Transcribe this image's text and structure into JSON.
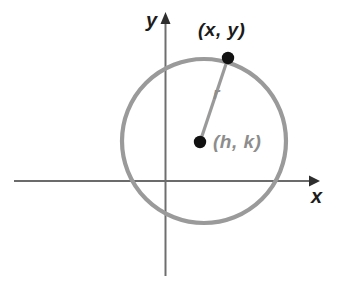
{
  "figure": {
    "kind": "circle-diagram",
    "background_color": "#ffffff"
  },
  "axes": {
    "x_label": "x",
    "y_label": "y",
    "x_axis_color": "#3a3a3a",
    "y_axis_color": "#6e6e6e",
    "origin": {
      "x": 165,
      "y": 181
    },
    "x_axis_start_x": 14,
    "x_axis_end_x": 314,
    "y_axis_top_y": 14,
    "y_axis_bottom_y": 276,
    "x_arrow": "arrow-right",
    "y_arrow": "arrow-up"
  },
  "circle": {
    "center_x": 204,
    "center_y": 141,
    "radius": 82,
    "stroke_color": "#9a9a9a",
    "stroke_width": 4,
    "fill": "none"
  },
  "radius_segment": {
    "from_x": 200,
    "from_y": 142,
    "to_x": 228,
    "to_y": 58,
    "color": "#9a9a9a",
    "stroke_width": 3,
    "label": "r"
  },
  "points": [
    {
      "name": "point-on-circle",
      "label": "(x, y)",
      "cx": 228,
      "cy": 58,
      "r": 6,
      "color": "#111111",
      "label_color": "#1a1a1a"
    },
    {
      "name": "circle-center",
      "label": "(h, k)",
      "cx": 200,
      "cy": 142,
      "r": 6,
      "color": "#111111",
      "label_color": "#8d8d8d"
    }
  ],
  "colors": {
    "circle_gray": "#9a9a9a",
    "label_gray": "#8d8d8d",
    "ink_black": "#1a1a1a",
    "axis_dark": "#3a3a3a"
  }
}
